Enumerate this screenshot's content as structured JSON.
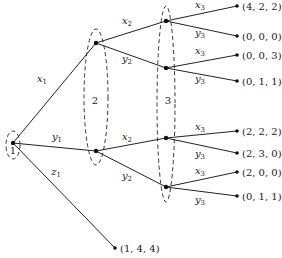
{
  "game_tree": {
    "players": [
      "1",
      "2",
      "3"
    ],
    "root": {
      "id": "r",
      "player": "1",
      "x": 13,
      "y": 143
    },
    "decision_nodes": [
      {
        "id": "A",
        "player": "2",
        "x": 96,
        "y": 43
      },
      {
        "id": "B",
        "player": "2",
        "x": 96,
        "y": 151
      },
      {
        "id": "C",
        "player": "3",
        "x": 166,
        "y": 21
      },
      {
        "id": "D",
        "player": "3",
        "x": 166,
        "y": 68
      },
      {
        "id": "E",
        "player": "3",
        "x": 166,
        "y": 138
      },
      {
        "id": "F",
        "player": "3",
        "x": 166,
        "y": 187
      }
    ],
    "edges": [
      {
        "from": "r",
        "to": "A",
        "label": "x",
        "sub": "1",
        "lx": 42,
        "ly": 82
      },
      {
        "from": "r",
        "to": "B",
        "label": "y",
        "sub": "1",
        "lx": 57,
        "ly": 140
      },
      {
        "from": "r",
        "to": "T9",
        "label": "z",
        "sub": "1",
        "lx": 56,
        "ly": 175
      },
      {
        "from": "A",
        "to": "C",
        "label": "x",
        "sub": "2",
        "lx": 127,
        "ly": 24
      },
      {
        "from": "A",
        "to": "D",
        "label": "y",
        "sub": "2",
        "lx": 127,
        "ly": 62
      },
      {
        "from": "B",
        "to": "E",
        "label": "x",
        "sub": "2",
        "lx": 127,
        "ly": 140
      },
      {
        "from": "B",
        "to": "F",
        "label": "y",
        "sub": "2",
        "lx": 127,
        "ly": 179
      },
      {
        "from": "C",
        "to": "T1",
        "label": "x",
        "sub": "3",
        "lx": 200,
        "ly": 8
      },
      {
        "from": "C",
        "to": "T2",
        "label": "y",
        "sub": "3",
        "lx": 200,
        "ly": 36
      },
      {
        "from": "D",
        "to": "T3",
        "label": "x",
        "sub": "3",
        "lx": 200,
        "ly": 54
      },
      {
        "from": "D",
        "to": "T4",
        "label": "y",
        "sub": "3",
        "lx": 200,
        "ly": 82
      },
      {
        "from": "E",
        "to": "T5",
        "label": "x",
        "sub": "3",
        "lx": 200,
        "ly": 130
      },
      {
        "from": "E",
        "to": "T6",
        "label": "y",
        "sub": "3",
        "lx": 200,
        "ly": 157
      },
      {
        "from": "F",
        "to": "T7",
        "label": "x",
        "sub": "3",
        "lx": 200,
        "ly": 174
      },
      {
        "from": "F",
        "to": "T8",
        "label": "y",
        "sub": "3",
        "lx": 200,
        "ly": 203
      }
    ],
    "terminals": [
      {
        "id": "T1",
        "x": 237,
        "y": 6,
        "payoff": "(4, 2, 2)"
      },
      {
        "id": "T2",
        "x": 237,
        "y": 36,
        "payoff": "(0, 0, 0)"
      },
      {
        "id": "T3",
        "x": 237,
        "y": 55,
        "payoff": "(0, 0, 3)"
      },
      {
        "id": "T4",
        "x": 237,
        "y": 81,
        "payoff": "(0, 1, 1)"
      },
      {
        "id": "T5",
        "x": 237,
        "y": 131,
        "payoff": "(2, 2, 2)"
      },
      {
        "id": "T6",
        "x": 237,
        "y": 153,
        "payoff": "(2, 3, 0)"
      },
      {
        "id": "T7",
        "x": 237,
        "y": 172,
        "payoff": "(2, 0, 0)"
      },
      {
        "id": "T8",
        "x": 237,
        "y": 196,
        "payoff": "(0, 1, 1)"
      },
      {
        "id": "T9",
        "x": 115,
        "y": 248,
        "payoff": "(1, 4, 4)"
      }
    ],
    "information_sets": [
      {
        "label": "1",
        "cx": 13,
        "cy": 145,
        "rx": 7,
        "ry": 14,
        "lx": 13,
        "ly": 154
      },
      {
        "label": "2",
        "cx": 96,
        "cy": 97,
        "rx": 12,
        "ry": 68,
        "lx": 95,
        "ly": 104
      },
      {
        "label": "3",
        "cx": 166,
        "cy": 104,
        "rx": 9,
        "ry": 98,
        "lx": 168,
        "ly": 104
      }
    ]
  }
}
